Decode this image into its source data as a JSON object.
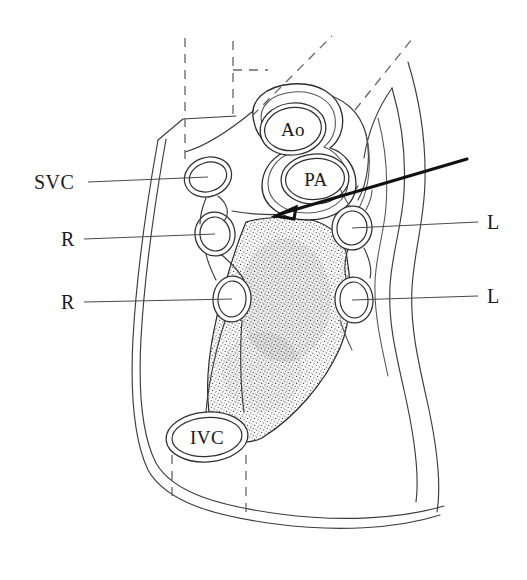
{
  "figure": {
    "background_color": "#ffffff",
    "line_color": "#2e2e2e",
    "label_color": "#1a1a1a",
    "width": 527,
    "height": 580
  },
  "labels": {
    "left": [
      {
        "id": "svc",
        "text": "SVC",
        "x": 34,
        "y": 189,
        "leader_from_x": 88,
        "leader_from_y": 182,
        "leader_to_x": 208,
        "leader_to_y": 177
      },
      {
        "id": "r_upper",
        "text": "R",
        "x": 61,
        "y": 246,
        "leader_from_x": 84,
        "leader_from_y": 239,
        "leader_to_x": 215,
        "leader_to_y": 234
      },
      {
        "id": "r_lower",
        "text": "R",
        "x": 61,
        "y": 309,
        "leader_from_x": 84,
        "leader_from_y": 302,
        "leader_to_x": 232,
        "leader_to_y": 299
      }
    ],
    "right": [
      {
        "id": "l_upper",
        "text": "L",
        "x": 487,
        "y": 229,
        "leader_from_x": 478,
        "leader_from_y": 222,
        "leader_to_x": 352,
        "leader_to_y": 228
      },
      {
        "id": "l_lower",
        "text": "L",
        "x": 487,
        "y": 303,
        "leader_from_x": 478,
        "leader_from_y": 296,
        "leader_to_x": 352,
        "leader_to_y": 300
      }
    ],
    "structures": [
      {
        "id": "ao",
        "text": "Ao",
        "x": 277,
        "y": 134
      },
      {
        "id": "pa",
        "text": "PA",
        "x": 300,
        "y": 184
      },
      {
        "id": "ivc",
        "text": "IVC",
        "x": 185,
        "y": 443
      }
    ]
  },
  "annotations": {
    "pointer_arrow": {
      "name": "pointer-arrow",
      "tail_x": 467,
      "tail_y": 159,
      "head_x": 276,
      "head_y": 216
    },
    "dashed_guides": [
      {
        "id": "vertical-left",
        "x1": 185,
        "y1": 38,
        "x2": 185,
        "y2": 160
      },
      {
        "id": "vertical-mid",
        "x1": 233,
        "y1": 41,
        "x2": 233,
        "y2": 120
      },
      {
        "id": "horizontal-mid",
        "x1": 233,
        "y1": 70,
        "x2": 264,
        "y2": 70
      },
      {
        "id": "diagonal-inner",
        "x1": 258,
        "y1": 112,
        "x2": 332,
        "y2": 36
      },
      {
        "id": "diagonal-outer",
        "x1": 357,
        "y1": 109,
        "x2": 412,
        "y2": 39
      },
      {
        "id": "ivc-drop-left",
        "x1": 172,
        "y1": 455,
        "x2": 172,
        "y2": 500
      },
      {
        "id": "ivc-drop-right",
        "x1": 246,
        "y1": 455,
        "x2": 246,
        "y2": 513
      }
    ]
  },
  "vessels": {
    "left_column": [
      {
        "id": "svc-vessel",
        "cx": 208,
        "cy": 177,
        "rx": 23,
        "ry": 19,
        "rot": -18
      },
      {
        "id": "r-upper-vessel",
        "cx": 215,
        "cy": 234,
        "rx": 19,
        "ry": 21,
        "rot": -6
      },
      {
        "id": "r-lower-vessel",
        "cx": 232,
        "cy": 299,
        "rx": 18,
        "ry": 22,
        "rot": 4
      }
    ],
    "right_column": [
      {
        "id": "l-upper-vessel",
        "cx": 352,
        "cy": 228,
        "rx": 19,
        "ry": 21,
        "rot": 6
      },
      {
        "id": "l-lower-vessel",
        "cx": 354,
        "cy": 300,
        "rx": 18,
        "ry": 22,
        "rot": -4
      }
    ],
    "great_vessels": [
      {
        "id": "ao-vessel",
        "cx": 293,
        "cy": 129,
        "rx": 33,
        "ry": 26,
        "rot": -8
      },
      {
        "id": "pa-vessel",
        "cx": 315,
        "cy": 179,
        "rx": 34,
        "ry": 25,
        "rot": -4
      }
    ],
    "ivc_vessel": {
      "id": "ivc-vessel",
      "cx": 207,
      "cy": 437,
      "rx": 40,
      "ry": 24,
      "rot": -4
    }
  },
  "stipple_region": {
    "name": "stippled-soft-tissue",
    "dot_color": "#3a3a3a",
    "dot_count": 2600
  }
}
